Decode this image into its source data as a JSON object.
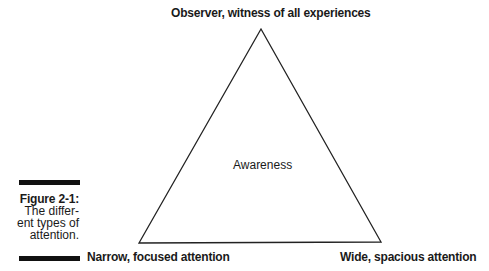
{
  "figure": {
    "label": "Figure 2-1:",
    "caption_lines": [
      "The differ-",
      "ent types of",
      "attention."
    ]
  },
  "diagram": {
    "shape": "triangle",
    "center_label": "Awareness",
    "vertices": {
      "top": "Observer, witness of all experiences",
      "bottom_left": "Narrow, focused attention",
      "bottom_right": "Wide, spacious attention"
    },
    "stroke_color": "#222222"
  }
}
